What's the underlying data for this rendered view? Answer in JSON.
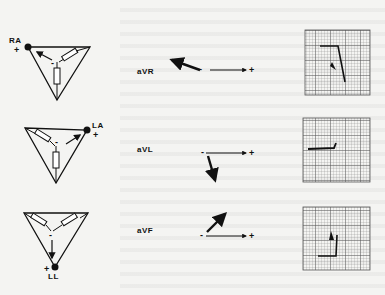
{
  "figure": {
    "rows": [
      {
        "lead": "aVR",
        "electrode": "RA",
        "electrode_polarity": "+",
        "center_polarity": "-",
        "axis_neg_label": "-",
        "axis_pos_label": "+",
        "ecg_deflection": "negative"
      },
      {
        "lead": "aVL",
        "electrode": "LA",
        "electrode_polarity": "+",
        "center_polarity": "-",
        "axis_neg_label": "-",
        "axis_pos_label": "+",
        "ecg_deflection": "small positive"
      },
      {
        "lead": "aVF",
        "electrode": "LL",
        "electrode_polarity": "+",
        "center_polarity": "-",
        "axis_neg_label": "-",
        "axis_pos_label": "+",
        "ecg_deflection": "positive"
      }
    ]
  },
  "colors": {
    "ink": "#111111",
    "background": "#f4f4f2",
    "grid": "#8a8a8a"
  }
}
